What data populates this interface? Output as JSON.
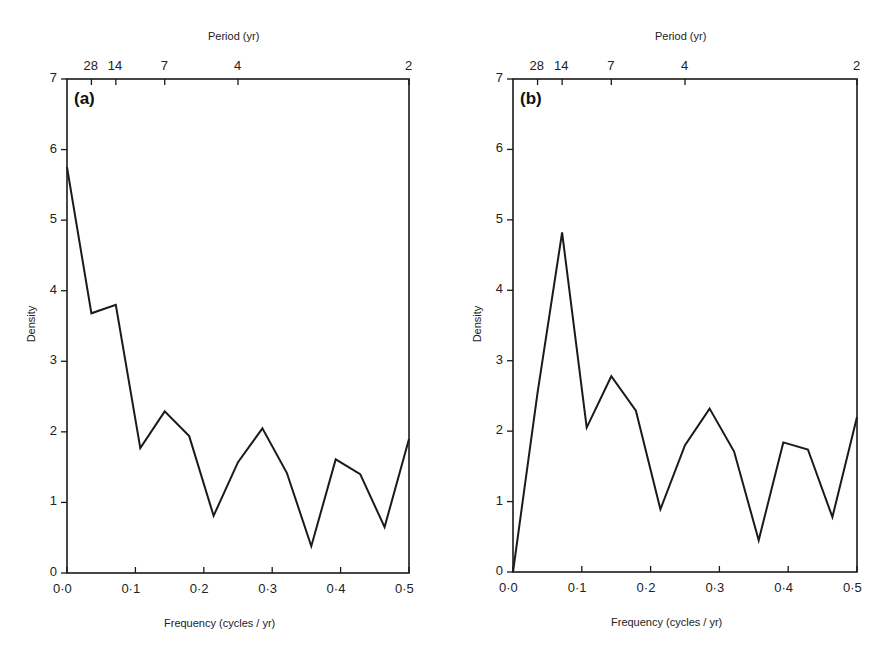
{
  "figure": {
    "panels": [
      {
        "tag": "(a)",
        "top_axis_title": "Period (yr)",
        "bottom_axis_title": "Frequency (cycles / yr)",
        "y_axis_title": "Density",
        "period_ticks": [
          "28",
          "14",
          "7",
          "4",
          "2"
        ],
        "x_ticks": [
          "0·0",
          "0·1",
          "0·2",
          "0·3",
          "0·4",
          "0·5"
        ],
        "y_ticks": [
          "0",
          "1",
          "2",
          "3",
          "4",
          "5",
          "6",
          "7"
        ]
      },
      {
        "tag": "(b)",
        "top_axis_title": "Period (yr)",
        "bottom_axis_title": "Frequency (cycles / yr)",
        "y_axis_title": "Density",
        "period_ticks": [
          "28",
          "14",
          "7",
          "4",
          "2"
        ],
        "x_ticks": [
          "0·0",
          "0·1",
          "0·2",
          "0·3",
          "0·4",
          "0·5"
        ],
        "y_ticks": [
          "0",
          "1",
          "2",
          "3",
          "4",
          "5",
          "6",
          "7"
        ]
      }
    ],
    "line_color": "#1a1a1a"
  },
  "chart_data": [
    {
      "type": "line",
      "title": "(a)",
      "xlabel": "Frequency (cycles / yr)",
      "ylabel": "Density",
      "secondary_xlabel": "Period (yr)",
      "secondary_x_ticks": [
        {
          "label": "28",
          "frequency": 0.0357
        },
        {
          "label": "14",
          "frequency": 0.0714
        },
        {
          "label": "7",
          "frequency": 0.1429
        },
        {
          "label": "4",
          "frequency": 0.25
        },
        {
          "label": "2",
          "frequency": 0.5
        }
      ],
      "xlim": [
        0,
        0.5
      ],
      "ylim": [
        0,
        7
      ],
      "x_tick_values": [
        0.0,
        0.1,
        0.2,
        0.3,
        0.4,
        0.5
      ],
      "y_tick_values": [
        0,
        1,
        2,
        3,
        4,
        5,
        6,
        7
      ],
      "grid": false,
      "legend": null,
      "x": [
        0.0,
        0.0357,
        0.0714,
        0.1071,
        0.1429,
        0.1786,
        0.2143,
        0.25,
        0.2857,
        0.3214,
        0.3571,
        0.3929,
        0.4286,
        0.4643,
        0.5
      ],
      "series": [
        {
          "name": "spectral density (a)",
          "values": [
            5.75,
            3.68,
            3.8,
            1.77,
            2.29,
            1.94,
            0.81,
            1.57,
            2.05,
            1.42,
            0.38,
            1.61,
            1.4,
            0.65,
            1.9
          ]
        }
      ]
    },
    {
      "type": "line",
      "title": "(b)",
      "xlabel": "Frequency (cycles / yr)",
      "ylabel": "Density",
      "secondary_xlabel": "Period (yr)",
      "secondary_x_ticks": [
        {
          "label": "28",
          "frequency": 0.0357
        },
        {
          "label": "14",
          "frequency": 0.0714
        },
        {
          "label": "7",
          "frequency": 0.1429
        },
        {
          "label": "4",
          "frequency": 0.25
        },
        {
          "label": "2",
          "frequency": 0.5
        }
      ],
      "xlim": [
        0,
        0.5
      ],
      "ylim": [
        0,
        7
      ],
      "x_tick_values": [
        0.0,
        0.1,
        0.2,
        0.3,
        0.4,
        0.5
      ],
      "y_tick_values": [
        0,
        1,
        2,
        3,
        4,
        5,
        6,
        7
      ],
      "grid": false,
      "legend": null,
      "x": [
        0.0,
        0.0357,
        0.0714,
        0.1071,
        0.1429,
        0.1786,
        0.2143,
        0.25,
        0.2857,
        0.3214,
        0.3571,
        0.3929,
        0.4286,
        0.4643,
        0.5
      ],
      "series": [
        {
          "name": "spectral density (b)",
          "values": [
            0.0,
            2.55,
            4.82,
            2.05,
            2.78,
            2.29,
            0.89,
            1.8,
            2.32,
            1.71,
            0.45,
            1.84,
            1.74,
            0.78,
            2.2
          ]
        }
      ]
    }
  ]
}
